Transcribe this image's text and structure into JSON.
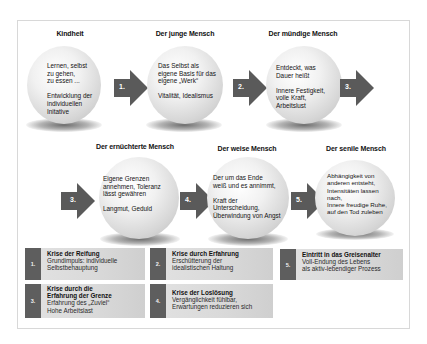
{
  "diagram": {
    "stages": [
      {
        "title": "Kindheit",
        "text": "Lernen, selbst\nzu gehen,\nzu essen ...\n\nEntwicklung der\nindividuellen\nInitative"
      },
      {
        "title": "Der junge Mensch",
        "text": "Das Selbst als\neigene Basis für das\neigene „Werk“\n\nVitalität, Idealismus"
      },
      {
        "title": "Der mündige Mensch",
        "text": "Entdeckt, was\nDauer heißt\n\nInnere Festigkeit,\nvolle Kraft,\nArbeitslust"
      },
      {
        "title": "Der ernüchterte Mensch",
        "text": "Eigene Grenzen\nannehmen, Toleranz\nlässt gewähren\n\nLangmut, Geduld"
      },
      {
        "title": "Der weise Mensch",
        "text": "Der um das Ende\nweiß und es annimmt,\n\nKraft der\nUnterscheidung,\nÜberwindung von Angst"
      },
      {
        "title": "Der senile Mensch",
        "text": "Abhängigkeit von\nanderen entsteht,\nIntensitäten lassen\nnach,\nInnere freudige Ruhe,\nauf den Tod zuleben"
      }
    ],
    "arrows": [
      {
        "label": "1."
      },
      {
        "label": "2."
      },
      {
        "label": "3."
      },
      {
        "label": "3."
      },
      {
        "label": "4."
      },
      {
        "label": "5."
      }
    ],
    "crises": [
      {
        "num": "1.",
        "title": "Krise der Reifung",
        "desc": "Grundimpuls: individuelle\nSelbstbehauptung"
      },
      {
        "num": "2.",
        "title": "Krise durch Erfahrung",
        "desc": "Erschütterung der\nidealistischen Haltung"
      },
      {
        "num": "5.",
        "title": "Eintritt in das Greisenalter",
        "desc": "Voll-Endung des Lebens\nals aktiv-lebendiger Prozess"
      },
      {
        "num": "3.",
        "title": "Krise durch die\nErfahrung der Grenze",
        "desc": "Erfahrung des „Zuviel“\nHohe Arbeitslast"
      },
      {
        "num": "4.",
        "title": "Krise der Loslösung",
        "desc": "Vergänglichkeit fühlbar,\nErwartungen reduzieren sich"
      }
    ],
    "colors": {
      "arrow": "#5a5a5a",
      "crisis_num_bg": "#5e5e5e",
      "crisis_bg": "#dcdcdc",
      "frame_border": "#d8d8d8"
    }
  }
}
